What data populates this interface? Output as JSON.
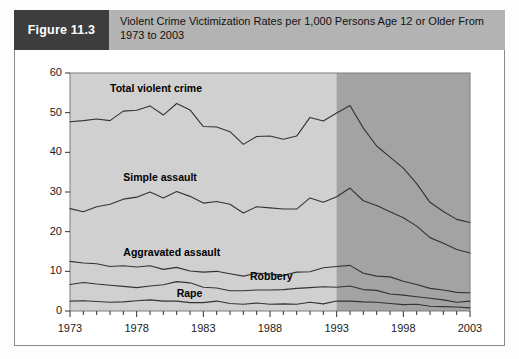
{
  "figure": {
    "tag": "Figure 11.3",
    "title": "Violent Crime Victimization Rates per 1,000 Persons Age 12 or Older From 1973 to 2003"
  },
  "colors": {
    "tag_bg": "#3d3d3d",
    "header_bg": "#b3b3b3",
    "plot_bg_light": "#d0d0d0",
    "plot_bg_dark": "#a3a3a3",
    "line": "#333333",
    "frame": "#8a8a8a"
  },
  "chart_data": {
    "type": "line",
    "title": "Violent Crime Victimization Rates per 1,000 Persons Age 12 or Older From 1973 to 2003",
    "xlabel": "",
    "ylabel": "",
    "xlim": [
      1973,
      2003
    ],
    "ylim": [
      0,
      60
    ],
    "grid": false,
    "legend_position": "inline-labels",
    "x_tick_labels": [
      "1973",
      "1978",
      "1983",
      "1988",
      "1993",
      "1998",
      "2003"
    ],
    "x_tick_values": [
      1973,
      1978,
      1983,
      1988,
      1993,
      1998,
      2003
    ],
    "x_minor_tick_step": 1,
    "y_tick_labels": [
      "0",
      "10",
      "20",
      "30",
      "40",
      "50",
      "60"
    ],
    "y_tick_values": [
      0,
      10,
      20,
      30,
      40,
      50,
      60
    ],
    "shaded_region": {
      "from": 1993,
      "to": 2003,
      "note": "darker shaded band"
    },
    "x": [
      1973,
      1974,
      1975,
      1976,
      1977,
      1978,
      1979,
      1980,
      1981,
      1982,
      1983,
      1984,
      1985,
      1986,
      1987,
      1988,
      1989,
      1990,
      1991,
      1992,
      1993,
      1994,
      1995,
      1996,
      1997,
      1998,
      1999,
      2000,
      2001,
      2002,
      2003
    ],
    "series": [
      {
        "name": "Total violent crime",
        "label_x": 1976.0,
        "label_y": 56.0,
        "values": [
          47.7,
          48.0,
          48.4,
          48.0,
          50.4,
          50.6,
          51.7,
          49.4,
          52.3,
          50.7,
          46.5,
          46.4,
          45.2,
          42.0,
          44.0,
          44.1,
          43.3,
          44.1,
          48.8,
          47.9,
          49.9,
          51.8,
          46.1,
          41.6,
          38.8,
          36.0,
          32.1,
          27.4,
          25.1,
          23.1,
          22.3
        ]
      },
      {
        "name": "Simple assault",
        "label_x": 1977.0,
        "label_y": 33.5,
        "values": [
          25.8,
          25.0,
          26.3,
          26.9,
          28.2,
          28.7,
          30.0,
          28.5,
          30.1,
          28.9,
          27.2,
          27.6,
          26.9,
          24.7,
          26.3,
          26.0,
          25.7,
          25.7,
          28.5,
          27.4,
          28.8,
          31.0,
          27.8,
          26.6,
          25.0,
          23.5,
          21.4,
          18.5,
          17.1,
          15.5,
          14.6
        ]
      },
      {
        "name": "Aggravated assault",
        "label_x": 1977.0,
        "label_y": 14.5,
        "values": [
          12.5,
          12.1,
          11.9,
          11.2,
          11.4,
          11.1,
          11.4,
          10.5,
          11.0,
          10.1,
          9.8,
          10.0,
          9.4,
          8.8,
          9.5,
          9.4,
          9.0,
          9.8,
          9.9,
          10.9,
          11.2,
          11.5,
          9.5,
          8.8,
          8.6,
          7.5,
          6.7,
          5.7,
          5.3,
          4.7,
          4.6
        ]
      },
      {
        "name": "Robbery",
        "label_x": 1986.5,
        "label_y": 8.5,
        "values": [
          6.7,
          7.2,
          6.8,
          6.5,
          6.2,
          5.9,
          6.3,
          6.6,
          7.4,
          7.1,
          6.0,
          5.8,
          5.1,
          5.1,
          5.3,
          5.3,
          5.4,
          5.7,
          5.9,
          6.1,
          6.0,
          6.3,
          5.4,
          5.2,
          4.3,
          4.0,
          3.6,
          3.2,
          2.8,
          2.2,
          2.5
        ]
      },
      {
        "name": "Rape",
        "label_x": 1981.0,
        "label_y": 4.2,
        "values": [
          2.5,
          2.6,
          2.4,
          2.2,
          2.3,
          2.6,
          2.8,
          2.5,
          2.5,
          2.1,
          2.1,
          2.5,
          1.9,
          1.7,
          2.0,
          1.7,
          1.8,
          1.7,
          2.2,
          1.8,
          2.5,
          2.5,
          2.3,
          2.2,
          1.9,
          1.6,
          1.7,
          1.2,
          1.1,
          1.0,
          0.8
        ]
      }
    ]
  }
}
